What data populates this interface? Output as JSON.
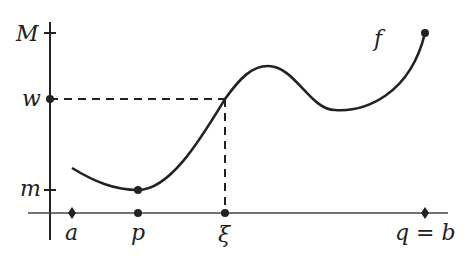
{
  "diagram": {
    "function_label": "f",
    "y_labels": {
      "max": "M",
      "mid": "w",
      "min": "m"
    },
    "x_labels": {
      "a": "a",
      "p": "p",
      "xi": "ξ",
      "qb": "q = b"
    },
    "colors": {
      "stroke": "#222222",
      "background": "#ffffff"
    }
  }
}
